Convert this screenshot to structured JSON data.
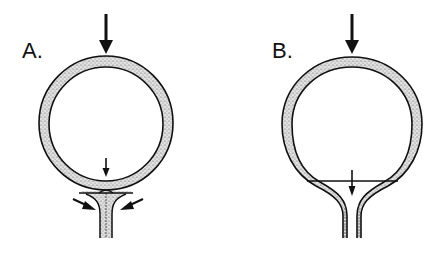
{
  "figure": {
    "panels": [
      {
        "id": "A",
        "label": "A.",
        "description": "Ring-shaped body compressed from above with a narrow stem at the bottom; stem pinched closed, with a small arrow pointing down at the junction and two oblique arrows pointing inward toward the stem."
      },
      {
        "id": "B",
        "label": "B.",
        "description": "Ring-shaped body compressed from above with a flared open neck at the bottom; horizontal line across the neck with a small arrow pointing down through it."
      }
    ],
    "colors": {
      "stroke": "#111111",
      "fill_stipple": "#c9c9c9",
      "background": "#ffffff"
    }
  }
}
